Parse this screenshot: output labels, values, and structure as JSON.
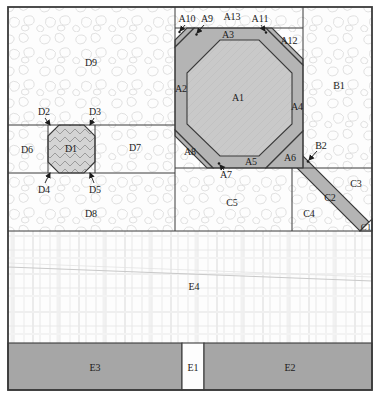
{
  "diagram": {
    "labels": {
      "a1": "A1",
      "a2": "A2",
      "a3": "A3",
      "a4": "A4",
      "a5": "A5",
      "a6": "A6",
      "a7": "A7",
      "a8": "A8",
      "a9": "A9",
      "a10": "A10",
      "a11": "A11",
      "a12": "A12",
      "a13": "A13",
      "b1": "B1",
      "b2": "B2",
      "c1": "C1",
      "c2": "C2",
      "c3": "C3",
      "c4": "C4",
      "c5": "C5",
      "d1": "D1",
      "d2": "D2",
      "d3": "D3",
      "d4": "D4",
      "d5": "D5",
      "d6": "D6",
      "d7": "D7",
      "d8": "D8",
      "d9": "D9",
      "e1": "E1",
      "e2": "E2",
      "e3": "E3",
      "e4": "E4"
    }
  },
  "colors": {
    "outline": "#3a3a3a",
    "patch_dark": "#b4b4b4",
    "patch_light": "#c9c9c9",
    "bar_gray": "#a6a6a6",
    "corner_white": "#fdfdfd",
    "texture_line": "#e1e1e1"
  }
}
